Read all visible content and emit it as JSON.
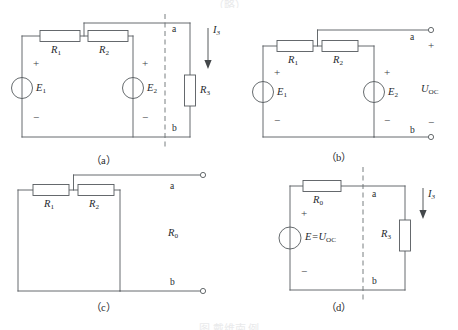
{
  "figure": {
    "top_clipped_text": "（略）",
    "bottom_caption": "图 戴维南 例",
    "subcaptions": {
      "a": "（a）",
      "b": "（b）",
      "c": "（c）",
      "d": "（d）"
    }
  },
  "circuit_a": {
    "name": "original-network-with-load",
    "resistor_r1": "R",
    "resistor_r1_sub": "1",
    "resistor_r2": "R",
    "resistor_r2_sub": "2",
    "resistor_r3": "R",
    "resistor_r3_sub": "3",
    "source_e1": "E",
    "source_e1_sub": "1",
    "source_e2": "E",
    "source_e2_sub": "2",
    "node_a": "a",
    "node_b": "b",
    "current_i3": "I",
    "current_i3_sub": "3",
    "plus_e1": "+",
    "minus_e1": "−",
    "plus_e2": "+",
    "minus_e2": "−"
  },
  "circuit_b": {
    "name": "open-circuit-voltage-network",
    "resistor_r1": "R",
    "resistor_r1_sub": "1",
    "resistor_r2": "R",
    "resistor_r2_sub": "2",
    "source_e1": "E",
    "source_e1_sub": "1",
    "source_e2": "E",
    "source_e2_sub": "2",
    "node_a": "a",
    "node_b": "b",
    "uoc": "U",
    "uoc_sub": "OC",
    "plus_e1": "+",
    "minus_e1": "−",
    "plus_e2": "+",
    "minus_e2": "−",
    "plus_term": "+",
    "minus_term": "−"
  },
  "circuit_c": {
    "name": "equivalent-resistance-network",
    "resistor_r1": "R",
    "resistor_r1_sub": "1",
    "resistor_r2": "R",
    "resistor_r2_sub": "2",
    "resistor_r0": "R",
    "resistor_r0_sub": "0",
    "node_a": "a",
    "node_b": "b"
  },
  "circuit_d": {
    "name": "thevenin-equivalent-circuit",
    "resistor_r0": "R",
    "resistor_r0_sub": "0",
    "resistor_r3": "R",
    "resistor_r3_sub": "3",
    "source_label": "E=U",
    "source_label_sub": "OC",
    "node_a": "a",
    "node_b": "b",
    "current_i3": "I",
    "current_i3_sub": "3",
    "plus_src": "+",
    "minus_src": "−"
  },
  "colors": {
    "wire": "#555a5e",
    "dashed": "#6a6f73",
    "text": "#26292c",
    "background": "#ffffff"
  }
}
